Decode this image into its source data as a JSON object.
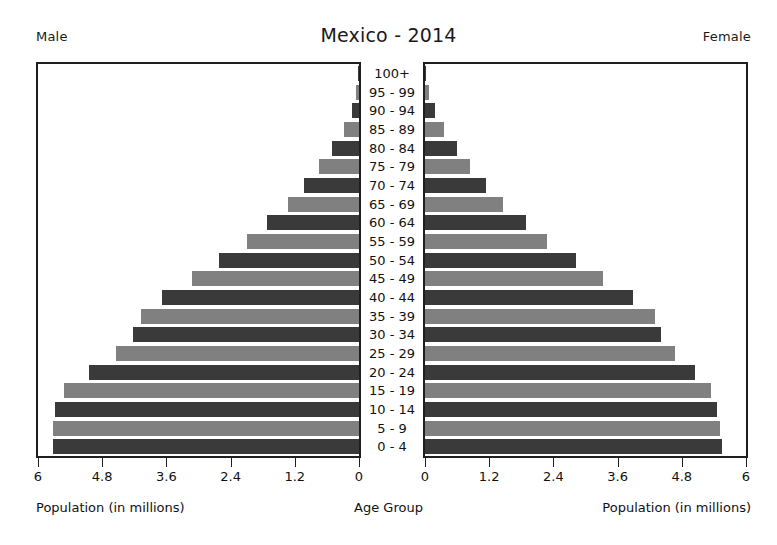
{
  "header": {
    "left_label": "Male",
    "right_label": "Female",
    "title": "Mexico - 2014"
  },
  "captions": {
    "left": "Population (in millions)",
    "center": "Age Group",
    "right": "Population (in millions)"
  },
  "axis": {
    "left_ticks": [
      "6",
      "4.8",
      "3.6",
      "2.4",
      "1.2",
      "0"
    ],
    "right_ticks": [
      "0",
      "1.2",
      "2.4",
      "3.6",
      "4.8",
      "6"
    ]
  },
  "colors": {
    "bar_dark": "#3a3a3a",
    "bar_light": "#808080",
    "frame": "#1f1f1f",
    "text": "#111111",
    "background": "#ffffff"
  },
  "chart_data": {
    "type": "bar",
    "title": "Mexico - 2014",
    "subtitle": "",
    "orientation": "horizontal-back-to-back population pyramid",
    "xlabel": "Population (in millions)",
    "ylabel": "Age Group",
    "xlim": [
      0,
      6
    ],
    "grid": false,
    "legend": [
      "Male",
      "Female"
    ],
    "legend_position": "top-left and top-right",
    "categories": [
      "0 - 4",
      "5 - 9",
      "10 - 14",
      "15 - 19",
      "20 - 24",
      "25 - 29",
      "30 - 34",
      "35 - 39",
      "40 - 44",
      "45 - 49",
      "50 - 54",
      "55 - 59",
      "60 - 64",
      "65 - 69",
      "70 - 74",
      "75 - 79",
      "80 - 84",
      "85 - 89",
      "90 - 94",
      "95 - 99",
      "100+"
    ],
    "series": [
      {
        "name": "Male",
        "side": "left",
        "values": [
          5.72,
          5.72,
          5.68,
          5.52,
          5.05,
          4.55,
          4.22,
          4.08,
          3.68,
          3.12,
          2.62,
          2.1,
          1.72,
          1.32,
          1.02,
          0.74,
          0.5,
          0.29,
          0.14,
          0.05,
          0.02
        ]
      },
      {
        "name": "Female",
        "side": "right",
        "values": [
          5.55,
          5.52,
          5.45,
          5.35,
          5.05,
          4.68,
          4.42,
          4.3,
          3.88,
          3.32,
          2.82,
          2.28,
          1.88,
          1.46,
          1.14,
          0.85,
          0.6,
          0.36,
          0.18,
          0.07,
          0.02
        ]
      }
    ]
  }
}
